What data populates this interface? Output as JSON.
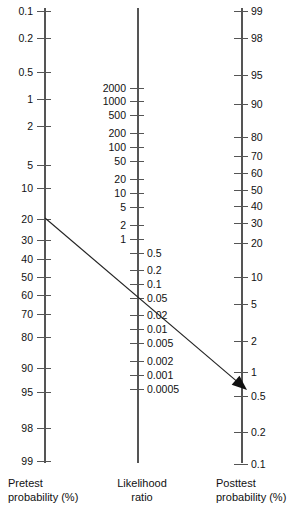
{
  "figure": {
    "type": "fagan-nomogram",
    "background_color": "#ffffff",
    "line_color": "#555555",
    "text_color": "#111111"
  },
  "chart_data": {
    "type": "line",
    "title": "",
    "subtitle": "",
    "xlabel": "",
    "ylabel": "",
    "grid": false,
    "legend": false,
    "axes": [
      {
        "name": "pretest-probability",
        "caption_lines": [
          "Pretest",
          "probability (%)"
        ],
        "label_side": "left",
        "x": 45,
        "y_top": 8,
        "y_bottom": 463,
        "ticks": [
          {
            "label": "0.1",
            "y": 11
          },
          {
            "label": "0.2",
            "y": 38
          },
          {
            "label": "0.5",
            "y": 72
          },
          {
            "label": "1",
            "y": 99
          },
          {
            "label": "2",
            "y": 126
          },
          {
            "label": "5",
            "y": 165
          },
          {
            "label": "10",
            "y": 188
          },
          {
            "label": "20",
            "y": 219
          },
          {
            "label": "30",
            "y": 240
          },
          {
            "label": "40",
            "y": 259
          },
          {
            "label": "50",
            "y": 277
          },
          {
            "label": "60",
            "y": 295
          },
          {
            "label": "70",
            "y": 314
          },
          {
            "label": "80",
            "y": 337
          },
          {
            "label": "90",
            "y": 368
          },
          {
            "label": "95",
            "y": 392
          },
          {
            "label": "98",
            "y": 428
          },
          {
            "label": "99",
            "y": 461
          }
        ]
      },
      {
        "name": "likelihood-ratio",
        "caption_lines": [
          "Likelihood",
          "ratio"
        ],
        "label_side": "both",
        "x": 138,
        "y_top": 8,
        "y_bottom": 463,
        "ticks_left": [
          {
            "label": "2000",
            "y": 88
          },
          {
            "label": "1000",
            "y": 101
          },
          {
            "label": "500",
            "y": 115
          },
          {
            "label": "200",
            "y": 133
          },
          {
            "label": "100",
            "y": 147
          },
          {
            "label": "50",
            "y": 161
          },
          {
            "label": "20",
            "y": 179
          },
          {
            "label": "10",
            "y": 193
          },
          {
            "label": "5",
            "y": 207
          },
          {
            "label": "2",
            "y": 225
          },
          {
            "label": "1",
            "y": 239
          }
        ],
        "ticks_right": [
          {
            "label": "0.5",
            "y": 253
          },
          {
            "label": "0.2",
            "y": 270
          },
          {
            "label": "0.1",
            "y": 284
          },
          {
            "label": "0.05",
            "y": 298
          },
          {
            "label": "0.02",
            "y": 315
          },
          {
            "label": "0.01",
            "y": 329
          },
          {
            "label": "0.005",
            "y": 343
          },
          {
            "label": "0.002",
            "y": 361
          },
          {
            "label": "0.001",
            "y": 375
          },
          {
            "label": "0.0005",
            "y": 389
          }
        ]
      },
      {
        "name": "posttest-probability",
        "caption_lines": [
          "Posttest",
          "probability (%)"
        ],
        "label_side": "right",
        "x": 242,
        "y_top": 8,
        "y_bottom": 463,
        "ticks": [
          {
            "label": "99",
            "y": 11
          },
          {
            "label": "98",
            "y": 38
          },
          {
            "label": "95",
            "y": 75
          },
          {
            "label": "90",
            "y": 104
          },
          {
            "label": "80",
            "y": 137
          },
          {
            "label": "70",
            "y": 156
          },
          {
            "label": "60",
            "y": 173
          },
          {
            "label": "50",
            "y": 190
          },
          {
            "label": "40",
            "y": 206
          },
          {
            "label": "30",
            "y": 223
          },
          {
            "label": "20",
            "y": 243
          },
          {
            "label": "10",
            "y": 277
          },
          {
            "label": "5",
            "y": 304
          },
          {
            "label": "2",
            "y": 341
          },
          {
            "label": "1",
            "y": 372
          },
          {
            "label": "0.5",
            "y": 396
          },
          {
            "label": "0.2",
            "y": 432
          },
          {
            "label": "0.1",
            "y": 464
          }
        ]
      }
    ],
    "annotation_line": {
      "name": "pretest-to-posttest-line",
      "start": {
        "x": 45,
        "y": 218,
        "axis": "pretest-probability",
        "value_approx": 19
      },
      "crossing": {
        "x": 138,
        "y": 304,
        "axis": "likelihood-ratio",
        "value_approx": 0.02
      },
      "end": {
        "x": 247,
        "y": 390,
        "axis": "posttest-probability",
        "value_approx": 0.5
      },
      "has_arrowhead": true,
      "color": "#222222"
    }
  }
}
